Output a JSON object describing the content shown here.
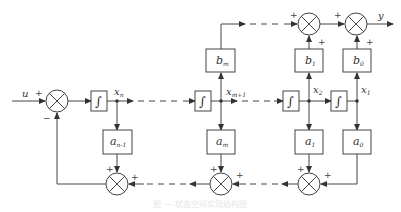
{
  "diagram": {
    "type": "block-diagram",
    "input_label": "u",
    "output_label": "y",
    "stroke_color": "#444444",
    "integrator_symbol": "∫",
    "state_labels": {
      "xn": "x",
      "xn_sub": "n",
      "xm1": "x",
      "xm1_sub": "m+1",
      "x2": "x",
      "x2_sub": "2",
      "x1": "x",
      "x1_sub": "1"
    },
    "feedforward_gains": [
      {
        "id": "bm",
        "label": "b",
        "sub": "m"
      },
      {
        "id": "b1",
        "label": "b",
        "sub": "1"
      },
      {
        "id": "b0",
        "label": "b",
        "sub": "0"
      }
    ],
    "feedback_gains": [
      {
        "id": "an1",
        "label": "a",
        "sub": "n-1"
      },
      {
        "id": "am",
        "label": "a",
        "sub": "m"
      },
      {
        "id": "a1",
        "label": "a",
        "sub": "1"
      },
      {
        "id": "a0",
        "label": "a",
        "sub": "0"
      }
    ],
    "signs": {
      "input_plus": "+",
      "feedback_minus": "−",
      "plus": "+"
    },
    "caption": "图 — 状态空间实现结构图"
  }
}
